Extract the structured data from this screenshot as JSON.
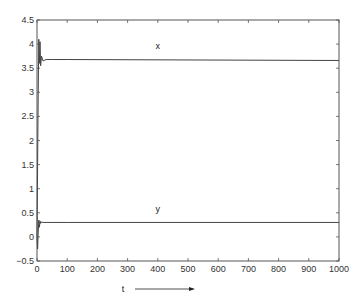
{
  "chart_data": {
    "type": "line",
    "title": "",
    "xlabel": "t",
    "ylabel": "",
    "xlim": [
      0,
      1000
    ],
    "ylim": [
      -0.5,
      4.5
    ],
    "grid": false,
    "legend": "inline labels",
    "x_ticks": [
      0,
      100,
      200,
      300,
      400,
      500,
      600,
      700,
      800,
      900,
      1000
    ],
    "y_ticks": [
      -0.5,
      0,
      0.5,
      1,
      1.5,
      2,
      2.5,
      3,
      3.5,
      4,
      4.5
    ],
    "x_tick_labels": [
      "0",
      "100",
      "200",
      "300",
      "400",
      "500",
      "600",
      "700",
      "800",
      "900",
      "1000"
    ],
    "y_tick_labels": [
      "-0.5",
      "0",
      "0.5",
      "1",
      "1.5",
      "2",
      "2.5",
      "3",
      "3.5",
      "4",
      "4.5"
    ],
    "series": [
      {
        "name": "x",
        "label": "x",
        "color": "#444444",
        "x": [
          0,
          2,
          4,
          6,
          8,
          10,
          12,
          15,
          20,
          30,
          50,
          100,
          1000
        ],
        "values": [
          0,
          1.5,
          3.0,
          4.1,
          3.6,
          4.05,
          3.55,
          3.75,
          3.65,
          3.68,
          3.68,
          3.68,
          3.66
        ]
      },
      {
        "name": "y",
        "label": "y",
        "color": "#444444",
        "x": [
          0,
          2,
          4,
          6,
          8,
          10,
          12,
          15,
          20,
          30,
          50,
          100,
          1000
        ],
        "values": [
          0,
          -0.25,
          0.1,
          0.35,
          0.2,
          0.33,
          0.28,
          0.31,
          0.3,
          0.3,
          0.3,
          0.3,
          0.3
        ]
      }
    ],
    "annotations": [
      {
        "text": "x",
        "x": 400,
        "y": 3.9
      },
      {
        "text": "y",
        "x": 400,
        "y": 0.52
      },
      {
        "text": "t",
        "arrow": "right",
        "position": "below x axis"
      }
    ]
  }
}
